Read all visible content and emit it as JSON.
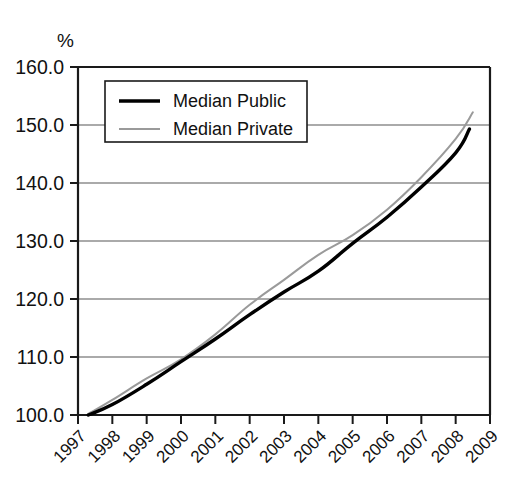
{
  "chart_data": {
    "type": "line",
    "title": "",
    "subtitle": "",
    "xlabel": "",
    "ylabel": "%",
    "y_unit_label": "%",
    "xlim": [
      1997,
      2009
    ],
    "ylim": [
      100.0,
      160.0
    ],
    "grid": true,
    "grid_axis": "y",
    "legend_position": "upper-left-inside",
    "x": [
      1997,
      1998,
      1999,
      2000,
      2001,
      2002,
      2003,
      2004,
      2005,
      2006,
      2007,
      2008,
      2009
    ],
    "categories": [
      "1997",
      "1998",
      "1999",
      "2000",
      "2001",
      "2002",
      "2003",
      "2004",
      "2005",
      "2006",
      "2007",
      "2008",
      "2009"
    ],
    "ytick_labels": [
      "160.0",
      "150.0",
      "140.0",
      "130.0",
      "120.0",
      "110.0",
      "100.0"
    ],
    "ytick_values": [
      160.0,
      150.0,
      140.0,
      130.0,
      120.0,
      110.0,
      100.0
    ],
    "series": [
      {
        "name": "Median Public",
        "color": "#000000",
        "style": "solid-thick",
        "x": [
          1997.3,
          1998,
          1999,
          2000,
          2001,
          2002,
          2003,
          2004,
          2005,
          2006,
          2007,
          2008,
          2008.4
        ],
        "values": [
          100.0,
          101.8,
          105.3,
          109.2,
          113.1,
          117.3,
          121.2,
          124.8,
          129.6,
          134.1,
          139.3,
          145.2,
          149.3
        ]
      },
      {
        "name": "Median Private",
        "color": "#9a9a9a",
        "style": "solid-thin",
        "x": [
          1997.3,
          1998,
          1999,
          2000,
          2001,
          2002,
          2003,
          2004,
          2005,
          2006,
          2007,
          2008,
          2008.5
        ],
        "values": [
          100.2,
          102.6,
          106.3,
          109.6,
          113.9,
          119.0,
          123.3,
          127.6,
          131.0,
          135.4,
          141.0,
          147.6,
          152.2
        ]
      }
    ],
    "legend_entries": [
      {
        "label": "Median Public",
        "color": "#000000",
        "style": "solid-thick"
      },
      {
        "label": "Median Private",
        "color": "#9a9a9a",
        "style": "solid-thin"
      }
    ]
  }
}
